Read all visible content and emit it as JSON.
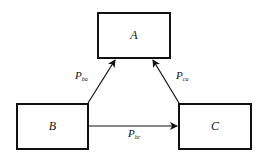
{
  "diagram": {
    "type": "flow",
    "nodes": [
      {
        "id": "A",
        "label": "A"
      },
      {
        "id": "B",
        "label": "B"
      },
      {
        "id": "C",
        "label": "C"
      }
    ],
    "edges": [
      {
        "from": "B",
        "to": "A",
        "label_main": "P",
        "label_sub": "ba"
      },
      {
        "from": "C",
        "to": "A",
        "label_main": "P",
        "label_sub": "ca"
      },
      {
        "from": "B",
        "to": "C",
        "label_main": "P",
        "label_sub": "bc"
      }
    ],
    "colors": {
      "stroke": "#111111",
      "background": "#ffffff"
    }
  }
}
